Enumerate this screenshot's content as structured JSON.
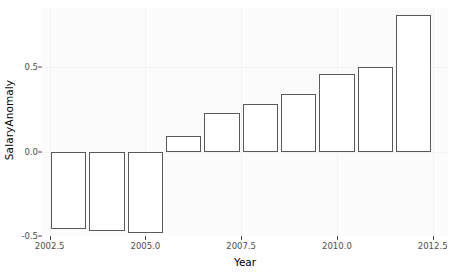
{
  "chart_data": {
    "type": "bar",
    "title": "",
    "xlabel": "Year",
    "ylabel": "SalaryAnomaly",
    "x": [
      2003,
      2004,
      2005,
      2006,
      2007,
      2008,
      2009,
      2010,
      2011,
      2012
    ],
    "categories": [
      "2003",
      "2004",
      "2005",
      "2006",
      "2007",
      "2008",
      "2009",
      "2010",
      "2011",
      "2012"
    ],
    "values": [
      -0.46,
      -0.47,
      -0.48,
      0.09,
      0.23,
      0.28,
      0.34,
      0.46,
      0.5,
      0.81
    ],
    "xlim": [
      2002.3,
      2012.9
    ],
    "ylim": [
      -0.5,
      0.85
    ],
    "xticks": [
      2002.5,
      2005.0,
      2007.5,
      2010.0,
      2012.5
    ],
    "xtick_labels": [
      "2002.5",
      "2005.0",
      "2007.5",
      "2010.0",
      "2012.5"
    ],
    "yticks": [
      -0.5,
      0.0,
      0.5
    ],
    "ytick_labels": [
      "-0.5",
      "0.0",
      "0.5"
    ],
    "grid": "faint",
    "legend": "none",
    "bar_fill": "#ffffff",
    "bar_border": "#595959",
    "panel_background": "#fbfbfb",
    "axis_text_color": "#4d4d4d",
    "bar_width_years": 0.92
  }
}
